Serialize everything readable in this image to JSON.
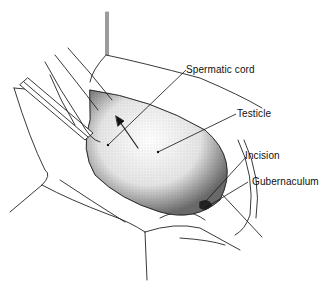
{
  "figure": {
    "type": "surgical-illustration",
    "labels": [
      {
        "id": "spermatic-cord",
        "text": "Spermatic cord"
      },
      {
        "id": "testicle",
        "text": "Testicle"
      },
      {
        "id": "incision",
        "text": "Incision"
      },
      {
        "id": "gubernaculum",
        "text": "Gubernaculum"
      }
    ]
  }
}
